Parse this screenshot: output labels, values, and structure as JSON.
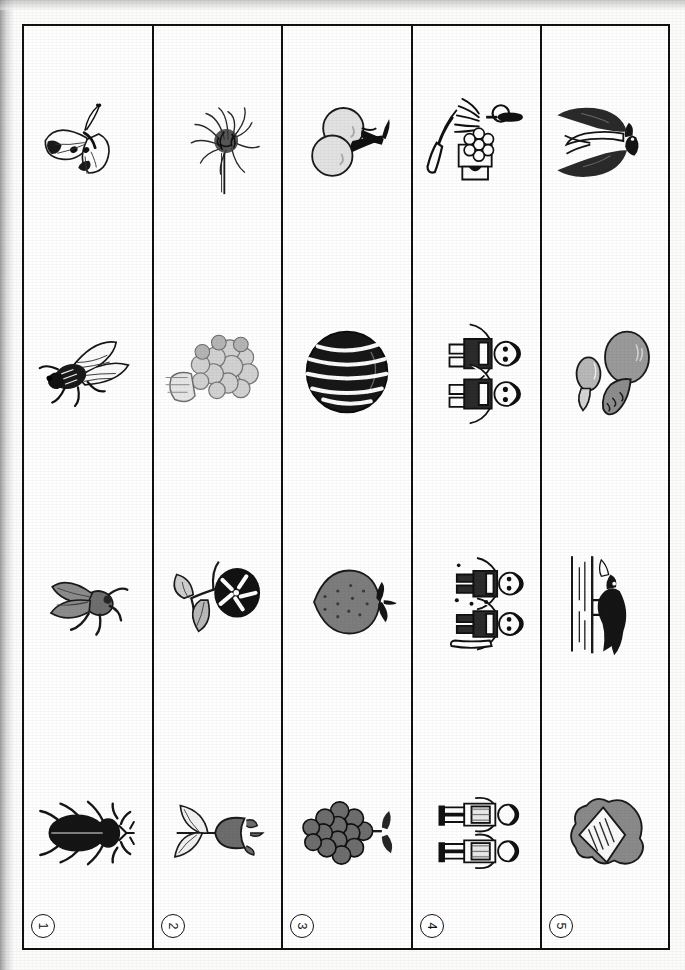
{
  "page": {
    "orientation": "rotated-90-left",
    "corner_mark": "15",
    "sheet_kind": "picture-worksheet",
    "background_color": "#fcfcfb",
    "ink_color": "#111111"
  },
  "rows": [
    {
      "number": "1",
      "index_label": "1",
      "theme": "insects",
      "cells": [
        {
          "position": 1,
          "icon": "stag-beetle-icon",
          "label": "stag beetle"
        },
        {
          "position": 2,
          "icon": "horsefly-icon",
          "label": "horsefly"
        },
        {
          "position": 3,
          "icon": "cicada-icon",
          "label": "cicada"
        },
        {
          "position": 4,
          "icon": "butterfly-icon",
          "label": "cabbage white butterfly"
        }
      ]
    },
    {
      "number": "2",
      "index_label": "2",
      "theme": "flowers",
      "cells": [
        {
          "position": 1,
          "icon": "tulip-icon",
          "label": "tulip"
        },
        {
          "position": 2,
          "icon": "morning-glory-icon",
          "label": "morning glory"
        },
        {
          "position": 3,
          "icon": "hydrangea-icon",
          "label": "hydrangea"
        },
        {
          "position": 4,
          "icon": "chrysanthemum-icon",
          "label": "chrysanthemum"
        }
      ]
    },
    {
      "number": "3",
      "index_label": "3",
      "theme": "fruits",
      "cells": [
        {
          "position": 1,
          "icon": "grapes-icon",
          "label": "grapes"
        },
        {
          "position": 2,
          "icon": "strawberry-icon",
          "label": "strawberry"
        },
        {
          "position": 3,
          "icon": "watermelon-icon",
          "label": "watermelon"
        },
        {
          "position": 4,
          "icon": "cherries-icon",
          "label": "cherries"
        }
      ]
    },
    {
      "number": "4",
      "index_label": "4",
      "theme": "school-life",
      "cells": [
        {
          "position": 1,
          "icon": "two-pupils-icon",
          "label": "two pupils with backpacks"
        },
        {
          "position": 2,
          "icon": "children-playing-icon",
          "label": "children playing in snow"
        },
        {
          "position": 3,
          "icon": "two-children-icon",
          "label": "two children"
        },
        {
          "position": 4,
          "icon": "broom-dustpan-icon",
          "label": "broom and cleaning tools"
        }
      ]
    },
    {
      "number": "5",
      "index_label": "5",
      "theme": "seasonal-nature",
      "cells": [
        {
          "position": 1,
          "icon": "folded-paper-icon",
          "label": "folded letter on rock"
        },
        {
          "position": 2,
          "icon": "wagtail-bird-icon",
          "label": "bird wading in water"
        },
        {
          "position": 3,
          "icon": "mushroom-icon",
          "label": "mushrooms"
        },
        {
          "position": 4,
          "icon": "swallow-icon",
          "label": "swallow"
        }
      ]
    }
  ]
}
